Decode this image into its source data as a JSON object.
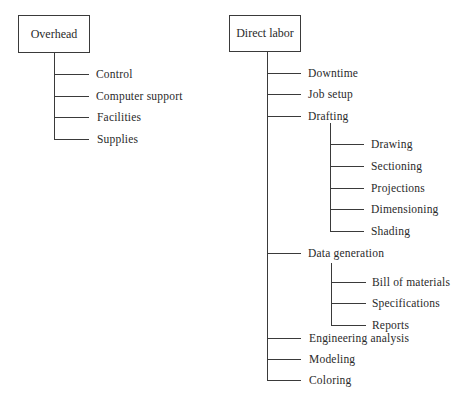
{
  "trees": [
    {
      "root": "Overhead",
      "children": [
        {
          "label": "Control"
        },
        {
          "label": "Computer support"
        },
        {
          "label": "Facilities"
        },
        {
          "label": "Supplies"
        }
      ]
    },
    {
      "root": "Direct labor",
      "children": [
        {
          "label": "Downtime"
        },
        {
          "label": "Job setup"
        },
        {
          "label": "Drafting",
          "children": [
            {
              "label": "Drawing"
            },
            {
              "label": "Sectioning"
            },
            {
              "label": "Projections"
            },
            {
              "label": "Dimensioning"
            },
            {
              "label": "Shading"
            }
          ]
        },
        {
          "label": "Data generation",
          "children": [
            {
              "label": "Bill of materials"
            },
            {
              "label": "Specifications"
            },
            {
              "label": "Reports"
            }
          ]
        },
        {
          "label": "Engineering analysis"
        },
        {
          "label": "Modeling"
        },
        {
          "label": "Coloring"
        }
      ]
    }
  ],
  "colors": {
    "line": "#3a3a3a",
    "text": "#2a2a2a",
    "background": "#ffffff"
  }
}
